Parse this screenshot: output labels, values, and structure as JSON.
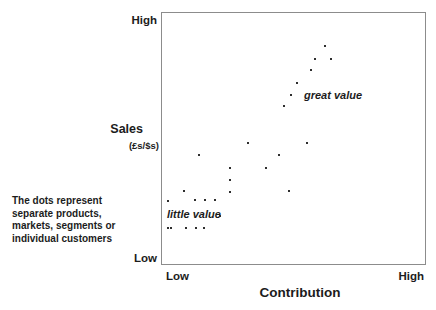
{
  "figure": {
    "y_axis": {
      "title": "Sales",
      "subtitle": "(£s/$s)",
      "top_label": "High",
      "bottom_label": "Low"
    },
    "x_axis": {
      "title": "Contribution",
      "left_label": "Low",
      "right_label": "High"
    },
    "annotations": {
      "side_note_lines": [
        "The dots represent",
        "separate products,",
        "markets, segments or",
        "individual customers"
      ],
      "great_value_label": "great value",
      "little_value_label": "little value"
    },
    "colors": {
      "background": "#ffffff",
      "text": "#1c1c1c",
      "box_border": "#8c8c8c",
      "dot": "#2e2e2e"
    }
  },
  "chart_data": {
    "type": "scatter",
    "title": "",
    "xlabel": "Contribution",
    "ylabel": "Sales (£s/$s)",
    "x_axis_end_labels": [
      "Low",
      "High"
    ],
    "y_axis_end_labels": [
      "Low",
      "High"
    ],
    "xlim": [
      0,
      1
    ],
    "ylim": [
      0,
      1
    ],
    "grid": false,
    "legend": "none",
    "annotation_labels": [
      {
        "text": "great value",
        "x": 0.55,
        "y": 0.64,
        "style": "bold-italic"
      },
      {
        "text": "little value",
        "x": 0.03,
        "y": 0.17,
        "style": "bold-italic"
      }
    ],
    "points_note": "x/y normalized 0-1 (Low-High); px = pixel offset inside plot box",
    "points": [
      {
        "x": 0.62,
        "y": 0.87,
        "px": [
          163,
          33
        ]
      },
      {
        "x": 0.58,
        "y": 0.82,
        "px": [
          153,
          46
        ]
      },
      {
        "x": 0.64,
        "y": 0.82,
        "px": [
          169,
          46
        ]
      },
      {
        "x": 0.57,
        "y": 0.77,
        "px": [
          149,
          57
        ]
      },
      {
        "x": 0.51,
        "y": 0.72,
        "px": [
          135,
          70
        ]
      },
      {
        "x": 0.49,
        "y": 0.67,
        "px": [
          129,
          82
        ]
      },
      {
        "x": 0.46,
        "y": 0.63,
        "px": [
          122,
          93
        ]
      },
      {
        "x": 0.33,
        "y": 0.48,
        "px": [
          86,
          130
        ]
      },
      {
        "x": 0.55,
        "y": 0.48,
        "px": [
          145,
          130
        ]
      },
      {
        "x": 0.14,
        "y": 0.43,
        "px": [
          37,
          142
        ]
      },
      {
        "x": 0.44,
        "y": 0.43,
        "px": [
          117,
          142
        ]
      },
      {
        "x": 0.26,
        "y": 0.38,
        "px": [
          68,
          155
        ]
      },
      {
        "x": 0.4,
        "y": 0.38,
        "px": [
          104,
          155
        ]
      },
      {
        "x": 0.26,
        "y": 0.33,
        "px": [
          68,
          167
        ]
      },
      {
        "x": 0.08,
        "y": 0.29,
        "px": [
          22,
          178
        ]
      },
      {
        "x": 0.26,
        "y": 0.29,
        "px": [
          68,
          179
        ]
      },
      {
        "x": 0.48,
        "y": 0.29,
        "px": [
          127,
          178
        ]
      },
      {
        "x": 0.02,
        "y": 0.25,
        "px": [
          6,
          188
        ]
      },
      {
        "x": 0.13,
        "y": 0.26,
        "px": [
          33,
          187
        ]
      },
      {
        "x": 0.16,
        "y": 0.26,
        "px": [
          43,
          187
        ]
      },
      {
        "x": 0.2,
        "y": 0.26,
        "px": [
          53,
          187
        ]
      },
      {
        "x": 0.22,
        "y": 0.19,
        "px": [
          58,
          203
        ]
      },
      {
        "x": 0.02,
        "y": 0.14,
        "px": [
          6,
          215
        ]
      },
      {
        "x": 0.03,
        "y": 0.14,
        "px": [
          9,
          215
        ]
      },
      {
        "x": 0.09,
        "y": 0.14,
        "px": [
          24,
          215
        ]
      },
      {
        "x": 0.13,
        "y": 0.14,
        "px": [
          34,
          215
        ]
      },
      {
        "x": 0.16,
        "y": 0.14,
        "px": [
          42,
          215
        ]
      }
    ]
  }
}
